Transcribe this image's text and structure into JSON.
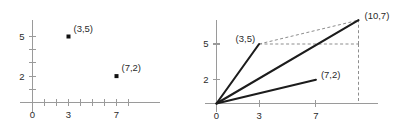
{
  "figure": {
    "title": "",
    "background_color": "#ffffff",
    "axis_color": "#9a9a9a",
    "vector_color": "#1c1c1c",
    "helper_color": "#8d8d8d",
    "label_color": "#2b2b2b"
  },
  "chart_data": [
    {
      "type": "scatter",
      "panel": "left",
      "title": "",
      "xlabel": "",
      "ylabel": "",
      "xlim": [
        -0.6,
        9.2
      ],
      "ylim": [
        -0.9,
        6.4
      ],
      "grid": false,
      "legend": null,
      "x_ticks": [
        1,
        2,
        3,
        4,
        5,
        6,
        7,
        8
      ],
      "y_ticks": [
        1,
        2,
        3,
        4,
        5
      ],
      "x_tick_labels": [
        {
          "value": 0,
          "text": "0"
        },
        {
          "value": 3,
          "text": "3"
        },
        {
          "value": 7,
          "text": "7"
        }
      ],
      "y_tick_labels": [
        {
          "value": 2,
          "text": "2"
        },
        {
          "value": 5,
          "text": "5"
        }
      ],
      "points": [
        {
          "x": 3,
          "y": 5,
          "label": "(3,5)",
          "label_anchor": "start",
          "label_dx": 5,
          "label_dy": -5
        },
        {
          "x": 7,
          "y": 2,
          "label": "(7,2)",
          "label_anchor": "start",
          "label_dx": 5,
          "label_dy": -5
        }
      ]
    },
    {
      "type": "line",
      "panel": "right",
      "title": "",
      "xlabel": "",
      "ylabel": "",
      "xlim": [
        -0.6,
        11.6
      ],
      "ylim": [
        -0.9,
        8.2
      ],
      "grid": false,
      "legend": null,
      "x_ticks": [
        3,
        7
      ],
      "y_ticks": [
        2,
        5
      ],
      "x_tick_labels": [
        {
          "value": 0,
          "text": "0"
        },
        {
          "value": 3,
          "text": "3"
        },
        {
          "value": 7,
          "text": "7"
        }
      ],
      "y_tick_labels": [
        {
          "value": 2,
          "text": "2"
        },
        {
          "value": 5,
          "text": "5"
        }
      ],
      "vectors": [
        {
          "name": "vector-a",
          "from": [
            0,
            0
          ],
          "to": [
            3,
            5
          ],
          "label": "(3,5)",
          "label_anchor": "end",
          "label_dx": -4,
          "label_dy": -2
        },
        {
          "name": "vector-b",
          "from": [
            0,
            0
          ],
          "to": [
            7,
            2
          ],
          "label": "(7,2)",
          "label_anchor": "start",
          "label_dx": 5,
          "label_dy": -2
        },
        {
          "name": "vector-sum",
          "from": [
            0,
            0
          ],
          "to": [
            10,
            7
          ],
          "label": "(10,7)",
          "label_anchor": "start",
          "label_dx": 6,
          "label_dy": -1
        }
      ],
      "helper_lines": [
        {
          "name": "dashed-a-to-sum",
          "from": [
            3,
            5
          ],
          "to": [
            10,
            7
          ]
        },
        {
          "name": "dashed-horizontal-from-a",
          "from": [
            3,
            5
          ],
          "to": [
            10,
            5
          ]
        },
        {
          "name": "dashed-vertical-at-ten",
          "from": [
            10,
            5
          ],
          "to": [
            10,
            7
          ]
        },
        {
          "name": "dashed-drop-to-axis",
          "from": [
            10,
            5
          ],
          "to": [
            10,
            0
          ]
        }
      ]
    }
  ]
}
